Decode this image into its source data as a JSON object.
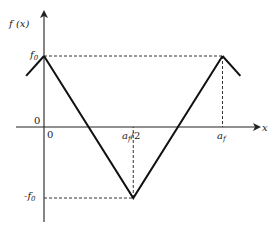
{
  "diagram": {
    "y_axis_label": "f (x)",
    "x_axis_label": "x",
    "origin_labels": [
      "0",
      "0"
    ],
    "y_ticks": [
      {
        "label": "f",
        "sub": "0",
        "value": 1
      },
      {
        "label": "-f",
        "sub": "0",
        "value": -1
      }
    ],
    "x_ticks": [
      {
        "label": "a",
        "sub": "f",
        "suffix": "/2",
        "value": 0.5
      },
      {
        "label": "a",
        "sub": "f",
        "suffix": "",
        "value": 1
      }
    ],
    "curve_points": [
      {
        "x": 0,
        "y": 1
      },
      {
        "x": 0.5,
        "y": -1
      },
      {
        "x": 1,
        "y": 1
      }
    ],
    "curve_extensions": [
      {
        "from": {
          "x": 0,
          "y": 1
        },
        "to": {
          "x": -0.1,
          "y": 0.72
        }
      },
      {
        "from": {
          "x": 1,
          "y": 1
        },
        "to": {
          "x": 1.1,
          "y": 0.72
        }
      }
    ]
  }
}
